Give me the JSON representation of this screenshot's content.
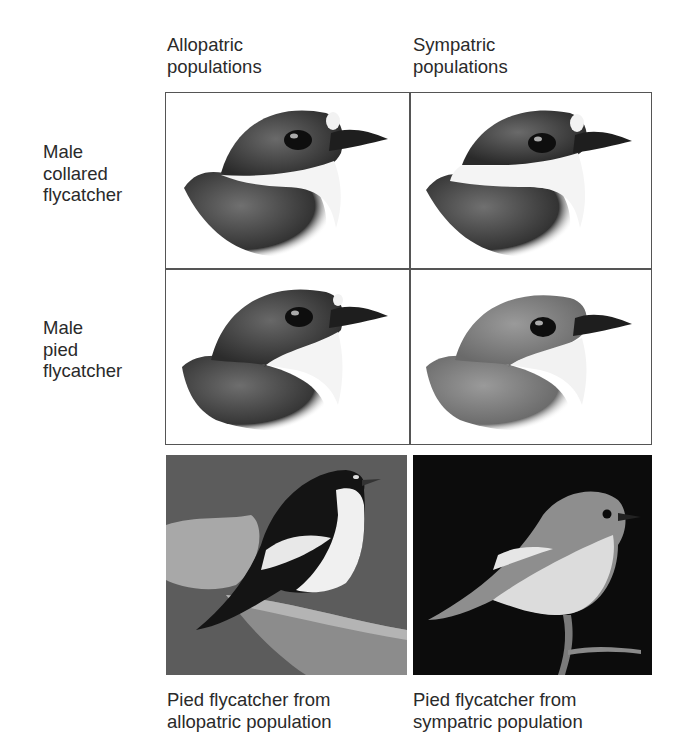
{
  "columns": [
    {
      "line1": "Allopatric",
      "line2": "populations"
    },
    {
      "line1": "Sympatric",
      "line2": "populations"
    }
  ],
  "rows": [
    {
      "line1": "Male",
      "line2": "collared",
      "line3": "flycatcher"
    },
    {
      "line1": "Male",
      "line2": "pied",
      "line3": "flycatcher"
    }
  ],
  "cells": [
    {
      "row": "collared",
      "column": "allopatric",
      "icon": "collared-flycatcher-head-illustration"
    },
    {
      "row": "collared",
      "column": "sympatric",
      "icon": "collared-flycatcher-head-illustration"
    },
    {
      "row": "pied",
      "column": "allopatric",
      "icon": "pied-flycatcher-dark-head-illustration"
    },
    {
      "row": "pied",
      "column": "sympatric",
      "icon": "pied-flycatcher-brown-head-illustration"
    }
  ],
  "photos": [
    {
      "icon": "black-white-pied-flycatcher-photo",
      "caption_line1": "Pied flycatcher from",
      "caption_line2": "allopatric population"
    },
    {
      "icon": "brown-pied-flycatcher-photo",
      "caption_line1": "Pied flycatcher from",
      "caption_line2": "sympatric population"
    }
  ],
  "colors": {
    "grid_border": "#555555",
    "photo_left_bg": "#5a5a5a",
    "photo_right_bg": "#0c0c0c"
  }
}
